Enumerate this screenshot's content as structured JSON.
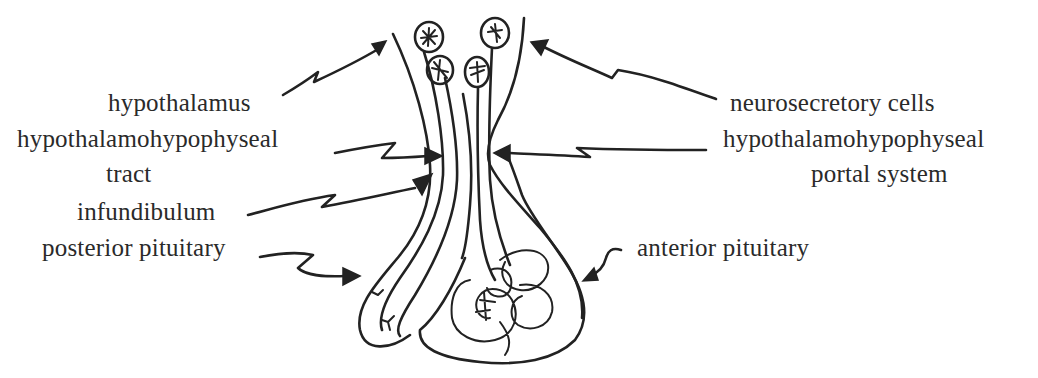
{
  "diagram": {
    "labels_left": {
      "hypothalamus": "hypothalamus",
      "tract_line1": "hypothalamohypophyseal",
      "tract_line2": "tract",
      "infundibulum": "infundibulum",
      "posterior_pituitary": "posterior pituitary"
    },
    "labels_right": {
      "neurosecretory_cells": "neurosecretory cells",
      "portal_line1": "hypothalamohypophyseal",
      "portal_line2": "portal system",
      "anterior_pituitary": "anterior pituitary"
    },
    "stroke_color": "#222222",
    "background_color": "#ffffff"
  }
}
